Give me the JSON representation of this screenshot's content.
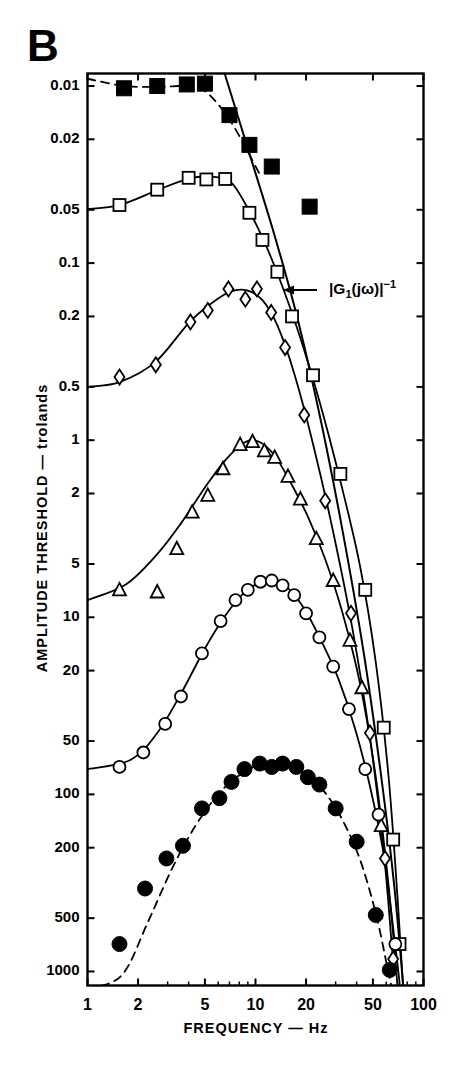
{
  "panel": {
    "label": "B"
  },
  "axes": {
    "y_title": "AMPLITUDE THRESHOLD  —  trolands",
    "x_title": "FREQUENCY  —  Hz",
    "y_ticks": [
      "0.01",
      "0.02",
      "0.05",
      "0.1",
      "0.2",
      "0.5",
      "1",
      "2",
      "5",
      "10",
      "20",
      "50",
      "100",
      "200",
      "500",
      "1000"
    ],
    "x_ticks": [
      "1",
      "2",
      "5",
      "10",
      "20",
      "50",
      "100"
    ]
  },
  "annotations": [
    {
      "name": "g1-inverse",
      "base": "|G",
      "sub": "1",
      "mid": "(jω)|",
      "sup": "−1",
      "full": "|G₁(jω)|⁻¹"
    }
  ],
  "chart_data": {
    "type": "scatter",
    "title": "B",
    "xlabel": "FREQUENCY  —  Hz",
    "ylabel": "AMPLITUDE THRESHOLD  —  trolands",
    "xscale": "log",
    "yscale": "log-inverted",
    "xlim": [
      1,
      100
    ],
    "ylim": [
      0.0085,
      1200
    ],
    "grid": false,
    "legend": "none",
    "y_tick_values": [
      0.01,
      0.02,
      0.05,
      0.1,
      0.2,
      0.5,
      1,
      2,
      5,
      10,
      20,
      50,
      100,
      200,
      500,
      1000
    ],
    "x_tick_values": [
      1,
      2,
      5,
      10,
      20,
      50,
      100
    ],
    "series": [
      {
        "name": "filled-square",
        "marker": "filled-square",
        "curve": "dashed",
        "points": [
          {
            "x": 1.65,
            "y": 0.0103
          },
          {
            "x": 2.6,
            "y": 0.01
          },
          {
            "x": 3.9,
            "y": 0.0098
          },
          {
            "x": 5.0,
            "y": 0.0097
          },
          {
            "x": 7.0,
            "y": 0.0146
          },
          {
            "x": 9.2,
            "y": 0.0215
          },
          {
            "x": 12.5,
            "y": 0.0285
          },
          {
            "x": 21.0,
            "y": 0.048
          }
        ],
        "curve_points": [
          {
            "x": 1.0,
            "y": 0.0091
          },
          {
            "x": 1.65,
            "y": 0.01
          },
          {
            "x": 2.6,
            "y": 0.0101
          },
          {
            "x": 3.9,
            "y": 0.01
          },
          {
            "x": 4.8,
            "y": 0.0104
          },
          {
            "x": 6.0,
            "y": 0.0127
          },
          {
            "x": 7.5,
            "y": 0.0172
          },
          {
            "x": 9.0,
            "y": 0.0235
          },
          {
            "x": 10.5,
            "y": 0.031
          }
        ]
      },
      {
        "name": "open-square",
        "marker": "open-square",
        "curve": "solid",
        "points": [
          {
            "x": 1.55,
            "y": 0.047
          },
          {
            "x": 2.6,
            "y": 0.0385
          },
          {
            "x": 4.0,
            "y": 0.033
          },
          {
            "x": 5.1,
            "y": 0.0337
          },
          {
            "x": 6.6,
            "y": 0.0335
          },
          {
            "x": 9.2,
            "y": 0.052
          },
          {
            "x": 11.0,
            "y": 0.074
          },
          {
            "x": 13.5,
            "y": 0.112
          },
          {
            "x": 16.5,
            "y": 0.2
          },
          {
            "x": 22.0,
            "y": 0.43
          },
          {
            "x": 32.0,
            "y": 1.55
          },
          {
            "x": 45.0,
            "y": 7.0
          },
          {
            "x": 58.0,
            "y": 42.0
          },
          {
            "x": 66.0,
            "y": 180.0
          },
          {
            "x": 72.0,
            "y": 700.0
          }
        ],
        "curve_points": [
          {
            "x": 1.0,
            "y": 0.0495
          },
          {
            "x": 1.55,
            "y": 0.047
          },
          {
            "x": 2.6,
            "y": 0.0388
          },
          {
            "x": 4.0,
            "y": 0.0333
          },
          {
            "x": 5.6,
            "y": 0.0326
          },
          {
            "x": 7.2,
            "y": 0.0352
          },
          {
            "x": 9.2,
            "y": 0.051
          },
          {
            "x": 11.5,
            "y": 0.079
          },
          {
            "x": 14.0,
            "y": 0.125
          },
          {
            "x": 18.0,
            "y": 0.245
          },
          {
            "x": 24.0,
            "y": 0.6
          },
          {
            "x": 32.0,
            "y": 1.7
          },
          {
            "x": 42.0,
            "y": 5.2
          },
          {
            "x": 52.0,
            "y": 18.0
          },
          {
            "x": 62.0,
            "y": 80.0
          },
          {
            "x": 70.0,
            "y": 380.0
          },
          {
            "x": 75.5,
            "y": 1200.0
          }
        ]
      },
      {
        "name": "open-diamond",
        "marker": "open-diamond",
        "curve": "solid",
        "points": [
          {
            "x": 1.55,
            "y": 0.44
          },
          {
            "x": 2.55,
            "y": 0.375
          },
          {
            "x": 4.1,
            "y": 0.215
          },
          {
            "x": 5.2,
            "y": 0.185
          },
          {
            "x": 6.9,
            "y": 0.14
          },
          {
            "x": 8.7,
            "y": 0.16
          },
          {
            "x": 10.2,
            "y": 0.14
          },
          {
            "x": 12.4,
            "y": 0.19
          },
          {
            "x": 15.0,
            "y": 0.3
          },
          {
            "x": 19.5,
            "y": 0.72
          },
          {
            "x": 26.0,
            "y": 2.2
          },
          {
            "x": 37.0,
            "y": 9.5
          },
          {
            "x": 48.0,
            "y": 45.0
          },
          {
            "x": 59.0,
            "y": 230.0
          },
          {
            "x": 66.0,
            "y": 850.0
          }
        ],
        "curve_points": [
          {
            "x": 1.0,
            "y": 0.5
          },
          {
            "x": 1.55,
            "y": 0.47
          },
          {
            "x": 2.55,
            "y": 0.36
          },
          {
            "x": 4.0,
            "y": 0.218
          },
          {
            "x": 5.5,
            "y": 0.168
          },
          {
            "x": 7.2,
            "y": 0.144
          },
          {
            "x": 9.0,
            "y": 0.143
          },
          {
            "x": 11.0,
            "y": 0.162
          },
          {
            "x": 13.5,
            "y": 0.225
          },
          {
            "x": 17.0,
            "y": 0.42
          },
          {
            "x": 22.0,
            "y": 1.05
          },
          {
            "x": 29.0,
            "y": 3.3
          },
          {
            "x": 38.0,
            "y": 12.0
          },
          {
            "x": 48.0,
            "y": 48.0
          },
          {
            "x": 58.0,
            "y": 210.0
          },
          {
            "x": 66.0,
            "y": 900.0
          }
        ]
      },
      {
        "name": "open-triangle",
        "marker": "open-triangle",
        "curve": "solid",
        "points": [
          {
            "x": 1.55,
            "y": 7.0
          },
          {
            "x": 2.6,
            "y": 7.2
          },
          {
            "x": 3.4,
            "y": 4.1
          },
          {
            "x": 4.2,
            "y": 2.55
          },
          {
            "x": 5.2,
            "y": 2.05
          },
          {
            "x": 6.4,
            "y": 1.45
          },
          {
            "x": 8.1,
            "y": 1.06
          },
          {
            "x": 9.6,
            "y": 1.02
          },
          {
            "x": 11.3,
            "y": 1.15
          },
          {
            "x": 13.0,
            "y": 1.25
          },
          {
            "x": 15.6,
            "y": 1.6
          },
          {
            "x": 18.5,
            "y": 2.15
          },
          {
            "x": 23.0,
            "y": 3.6
          },
          {
            "x": 29.0,
            "y": 6.2
          },
          {
            "x": 36.5,
            "y": 13.5
          },
          {
            "x": 43.0,
            "y": 25.0
          },
          {
            "x": 56.0,
            "y": 150.0
          }
        ],
        "curve_points": [
          {
            "x": 1.0,
            "y": 8.0
          },
          {
            "x": 1.7,
            "y": 6.5
          },
          {
            "x": 2.6,
            "y": 4.4
          },
          {
            "x": 3.6,
            "y": 2.95
          },
          {
            "x": 5.0,
            "y": 1.85
          },
          {
            "x": 6.6,
            "y": 1.3
          },
          {
            "x": 8.6,
            "y": 1.03
          },
          {
            "x": 10.5,
            "y": 1.02
          },
          {
            "x": 13.0,
            "y": 1.22
          },
          {
            "x": 16.0,
            "y": 1.7
          },
          {
            "x": 20.5,
            "y": 2.7
          },
          {
            "x": 26.0,
            "y": 4.7
          },
          {
            "x": 33.0,
            "y": 9.5
          },
          {
            "x": 42.0,
            "y": 24.0
          },
          {
            "x": 52.0,
            "y": 80.0
          },
          {
            "x": 62.0,
            "y": 330.0
          },
          {
            "x": 70.0,
            "y": 1200.0
          }
        ]
      },
      {
        "name": "open-circle",
        "marker": "open-circle",
        "curve": "solid",
        "points": [
          {
            "x": 1.55,
            "y": 70.0
          },
          {
            "x": 2.15,
            "y": 58.0
          },
          {
            "x": 2.9,
            "y": 40.0
          },
          {
            "x": 3.6,
            "y": 28.0
          },
          {
            "x": 4.8,
            "y": 16.0
          },
          {
            "x": 6.2,
            "y": 10.5
          },
          {
            "x": 7.6,
            "y": 8.0
          },
          {
            "x": 9.0,
            "y": 7.0
          },
          {
            "x": 10.7,
            "y": 6.3
          },
          {
            "x": 12.5,
            "y": 6.2
          },
          {
            "x": 14.5,
            "y": 6.6
          },
          {
            "x": 17.0,
            "y": 7.5
          },
          {
            "x": 20.0,
            "y": 9.5
          },
          {
            "x": 24.0,
            "y": 13.0
          },
          {
            "x": 29.0,
            "y": 19.0
          },
          {
            "x": 36.0,
            "y": 33.0
          },
          {
            "x": 45.0,
            "y": 72.0
          },
          {
            "x": 54.0,
            "y": 130.0
          },
          {
            "x": 68.0,
            "y": 700.0
          }
        ],
        "curve_points": [
          {
            "x": 1.0,
            "y": 72.0
          },
          {
            "x": 1.8,
            "y": 64.0
          },
          {
            "x": 2.6,
            "y": 45.0
          },
          {
            "x": 3.6,
            "y": 27.0
          },
          {
            "x": 5.0,
            "y": 15.0
          },
          {
            "x": 6.6,
            "y": 9.8
          },
          {
            "x": 8.5,
            "y": 7.3
          },
          {
            "x": 10.5,
            "y": 6.4
          },
          {
            "x": 13.0,
            "y": 6.2
          },
          {
            "x": 16.0,
            "y": 7.0
          },
          {
            "x": 20.0,
            "y": 9.3
          },
          {
            "x": 25.0,
            "y": 14.0
          },
          {
            "x": 31.0,
            "y": 22.0
          },
          {
            "x": 39.0,
            "y": 42.0
          },
          {
            "x": 48.0,
            "y": 90.0
          },
          {
            "x": 58.0,
            "y": 220.0
          },
          {
            "x": 68.0,
            "y": 720.0
          },
          {
            "x": 73.0,
            "y": 1300.0
          }
        ]
      },
      {
        "name": "filled-circle",
        "marker": "filled-circle",
        "curve": "dashed",
        "points": [
          {
            "x": 1.55,
            "y": 700.0
          },
          {
            "x": 2.2,
            "y": 340.0
          },
          {
            "x": 2.95,
            "y": 230.0
          },
          {
            "x": 3.7,
            "y": 195.0
          },
          {
            "x": 4.8,
            "y": 120.0
          },
          {
            "x": 6.1,
            "y": 105.0
          },
          {
            "x": 7.2,
            "y": 85.0
          },
          {
            "x": 8.6,
            "y": 72.0
          },
          {
            "x": 10.6,
            "y": 67.0
          },
          {
            "x": 12.5,
            "y": 70.0
          },
          {
            "x": 14.5,
            "y": 67.0
          },
          {
            "x": 17.5,
            "y": 70.0
          },
          {
            "x": 20.5,
            "y": 80.0
          },
          {
            "x": 24.0,
            "y": 88.0
          },
          {
            "x": 30.0,
            "y": 120.0
          },
          {
            "x": 40.0,
            "y": 185.0
          },
          {
            "x": 52.0,
            "y": 480.0
          },
          {
            "x": 63.0,
            "y": 980.0
          }
        ],
        "curve_points": [
          {
            "x": 1.0,
            "y": 1250.0
          },
          {
            "x": 1.6,
            "y": 1050.0
          },
          {
            "x": 2.3,
            "y": 520.0
          },
          {
            "x": 3.2,
            "y": 260.0
          },
          {
            "x": 4.4,
            "y": 150.0
          },
          {
            "x": 6.0,
            "y": 100.0
          },
          {
            "x": 8.0,
            "y": 78.0
          },
          {
            "x": 10.5,
            "y": 68.0
          },
          {
            "x": 13.5,
            "y": 67.0
          },
          {
            "x": 17.0,
            "y": 70.0
          },
          {
            "x": 21.0,
            "y": 80.0
          },
          {
            "x": 26.0,
            "y": 98.0
          },
          {
            "x": 33.0,
            "y": 140.0
          },
          {
            "x": 42.0,
            "y": 235.0
          },
          {
            "x": 52.0,
            "y": 470.0
          },
          {
            "x": 61.0,
            "y": 950.0
          },
          {
            "x": 66.0,
            "y": 1350.0
          }
        ]
      },
      {
        "name": "g1-inverse-line",
        "marker": "none",
        "curve": "solid-straight",
        "points": [],
        "curve_points": [
          {
            "x": 6.55,
            "y": 0.0085
          },
          {
            "x": 9.0,
            "y": 0.0225
          },
          {
            "x": 13.0,
            "y": 0.07
          },
          {
            "x": 18.0,
            "y": 0.215
          },
          {
            "x": 25.0,
            "y": 0.85
          },
          {
            "x": 34.0,
            "y": 3.8
          },
          {
            "x": 45.0,
            "y": 18.0
          },
          {
            "x": 57.0,
            "y": 90.0
          },
          {
            "x": 67.0,
            "y": 330.0
          },
          {
            "x": 76.0,
            "y": 1250.0
          }
        ]
      }
    ]
  }
}
